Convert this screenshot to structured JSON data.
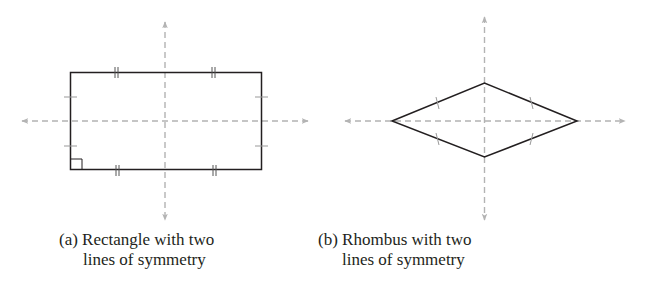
{
  "figure": {
    "panels": [
      {
        "id": "a",
        "shape": "rectangle",
        "caption_line1": "(a) Rectangle with two",
        "caption_line2": "lines of symmetry",
        "symmetry_lines": 2,
        "markings": {
          "long_sides": "double tick marks",
          "short_sides": "single tick marks",
          "right_angle": "bottom-left corner"
        }
      },
      {
        "id": "b",
        "shape": "rhombus",
        "caption_line1": "(b) Rhombus with two",
        "caption_line2": "lines of symmetry",
        "symmetry_lines": 2,
        "markings": {
          "all_sides": "single tick marks"
        }
      }
    ],
    "colors": {
      "shape_stroke": "#231f20",
      "axis_stroke": "#b3b3b3",
      "text": "#231f20"
    }
  }
}
